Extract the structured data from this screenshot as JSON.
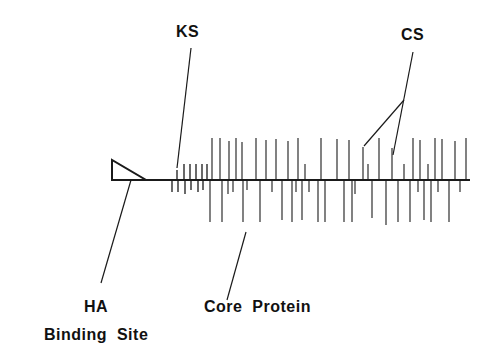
{
  "labels": {
    "ks": "KS",
    "cs": "CS",
    "ha": "HA",
    "binding_site": "Binding  Site",
    "core_protein": "Core  Protein"
  },
  "colors": {
    "stroke": "#1a1a1a",
    "background": "#ffffff"
  },
  "backbone": {
    "x1": 146,
    "x2": 470,
    "y": 180
  },
  "binding_site_triangle": [
    [
      112,
      160
    ],
    [
      112,
      180
    ],
    [
      146,
      180
    ]
  ],
  "ks_chains": {
    "up": [
      {
        "x": 177,
        "h": 10
      },
      {
        "x": 184,
        "h": 16
      },
      {
        "x": 190,
        "h": 16
      },
      {
        "x": 196,
        "h": 16
      },
      {
        "x": 202,
        "h": 16
      },
      {
        "x": 207,
        "h": 16
      }
    ],
    "down": [
      {
        "x": 172,
        "h": 12
      },
      {
        "x": 178,
        "h": 12
      },
      {
        "x": 185,
        "h": 14
      },
      {
        "x": 191,
        "h": 10
      },
      {
        "x": 198,
        "h": 12
      },
      {
        "x": 203,
        "h": 10
      }
    ]
  },
  "cs_chains": {
    "up": [
      {
        "x": 212,
        "h": 42
      },
      {
        "x": 220,
        "h": 42
      },
      {
        "x": 229,
        "h": 39
      },
      {
        "x": 236,
        "h": 42
      },
      {
        "x": 242,
        "h": 38
      },
      {
        "x": 256,
        "h": 42
      },
      {
        "x": 266,
        "h": 40
      },
      {
        "x": 276,
        "h": 41
      },
      {
        "x": 288,
        "h": 39
      },
      {
        "x": 298,
        "h": 42
      },
      {
        "x": 305,
        "h": 16
      },
      {
        "x": 321,
        "h": 42
      },
      {
        "x": 337,
        "h": 41
      },
      {
        "x": 349,
        "h": 40
      },
      {
        "x": 363,
        "h": 33
      },
      {
        "x": 368,
        "h": 16
      },
      {
        "x": 379,
        "h": 42
      },
      {
        "x": 392,
        "h": 32
      },
      {
        "x": 404,
        "h": 16
      },
      {
        "x": 413,
        "h": 42
      },
      {
        "x": 420,
        "h": 40
      },
      {
        "x": 428,
        "h": 16
      },
      {
        "x": 435,
        "h": 42
      },
      {
        "x": 442,
        "h": 41
      },
      {
        "x": 455,
        "h": 39
      },
      {
        "x": 466,
        "h": 42
      }
    ],
    "down": [
      {
        "x": 210,
        "h": 42
      },
      {
        "x": 222,
        "h": 42
      },
      {
        "x": 228,
        "h": 14
      },
      {
        "x": 233,
        "h": 12
      },
      {
        "x": 243,
        "h": 42
      },
      {
        "x": 247,
        "h": 10
      },
      {
        "x": 260,
        "h": 42
      },
      {
        "x": 272,
        "h": 12
      },
      {
        "x": 282,
        "h": 40
      },
      {
        "x": 292,
        "h": 42
      },
      {
        "x": 296,
        "h": 12
      },
      {
        "x": 302,
        "h": 40
      },
      {
        "x": 309,
        "h": 12
      },
      {
        "x": 318,
        "h": 42
      },
      {
        "x": 325,
        "h": 42
      },
      {
        "x": 344,
        "h": 42
      },
      {
        "x": 352,
        "h": 42
      },
      {
        "x": 355,
        "h": 14
      },
      {
        "x": 372,
        "h": 38
      },
      {
        "x": 386,
        "h": 45
      },
      {
        "x": 398,
        "h": 42
      },
      {
        "x": 410,
        "h": 42
      },
      {
        "x": 418,
        "h": 12
      },
      {
        "x": 424,
        "h": 40
      },
      {
        "x": 431,
        "h": 42
      },
      {
        "x": 438,
        "h": 12
      },
      {
        "x": 449,
        "h": 42
      },
      {
        "x": 460,
        "h": 12
      }
    ]
  },
  "pointers": [
    {
      "name": "ks-pointer",
      "x1": 191,
      "y1": 48,
      "x2": 177,
      "y2": 168
    },
    {
      "name": "cs-pointer-main",
      "x1": 413,
      "y1": 52,
      "x2": 393,
      "y2": 155
    },
    {
      "name": "cs-pointer-branch",
      "x1": 404,
      "y1": 100,
      "x2": 364,
      "y2": 146
    },
    {
      "name": "ha-pointer",
      "x1": 131,
      "y1": 180,
      "x2": 101,
      "y2": 283
    },
    {
      "name": "core-pointer",
      "x1": 246,
      "y1": 232,
      "x2": 227,
      "y2": 300
    }
  ],
  "label_positions": {
    "ks": {
      "x": 176,
      "y": 24
    },
    "cs": {
      "x": 401,
      "y": 27
    },
    "ha": {
      "x": 84,
      "y": 299
    },
    "binding_site": {
      "x": 44,
      "y": 327
    },
    "core_protein": {
      "x": 204,
      "y": 299
    }
  }
}
